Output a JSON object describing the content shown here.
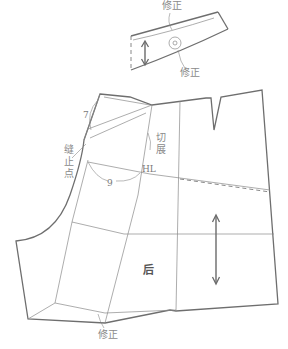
{
  "figure": {
    "type": "garment-pattern-diagram"
  },
  "waistband": {
    "labels": {
      "correction_top": "修正",
      "correction_bottom": "修正"
    }
  },
  "back_panel": {
    "labels": {
      "piece_name": "后",
      "seam_stop_point": "缝止点",
      "cut_spread": "切展",
      "hip_line": "HL",
      "measure_top": "7",
      "measure_hip": "9",
      "correction_hem": "修正"
    }
  },
  "colors": {
    "line": "#6e6e6e",
    "text": "#8a8a8a",
    "background": "#ffffff"
  }
}
